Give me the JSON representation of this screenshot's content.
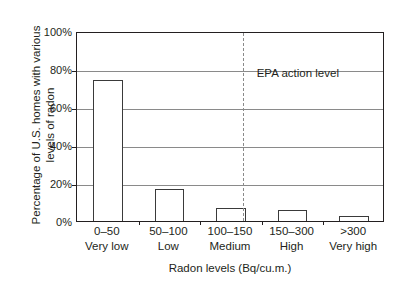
{
  "chart_data": {
    "type": "bar",
    "title": "",
    "xlabel": "Radon levels (Bq/cu.m.)",
    "ylabel": "Percentage of U.S. homes with various levels of radon",
    "ylabel_lines": [
      "Percentage of U.S. homes with various",
      "levels of radon"
    ],
    "categories": [
      "0–50",
      "50–100",
      "100–150",
      "150–300",
      ">300"
    ],
    "category_sublabels": [
      "Very low",
      "Low",
      "Medium",
      "High",
      "Very high"
    ],
    "values": [
      74,
      17,
      7,
      6,
      2.5
    ],
    "ylim": [
      0,
      100
    ],
    "ytick_values": [
      0,
      20,
      40,
      60,
      80,
      100
    ],
    "ytick_labels": [
      "0%",
      "20%",
      "40%",
      "60%",
      "80%",
      "100%"
    ],
    "grid": true,
    "legend": "none",
    "annotations": [
      {
        "name": "epa-action-level",
        "label": "EPA action level",
        "line_style": "dashed",
        "x_value": 150
      }
    ],
    "colors": {
      "bar_fill": "#ffffff",
      "bar_stroke": "#3a3a3a",
      "frame": "#231f20",
      "gridline": "#8a8a8a",
      "text": "#231f20",
      "annotation_line": "#8a8a8a",
      "background": "#ffffff"
    }
  }
}
